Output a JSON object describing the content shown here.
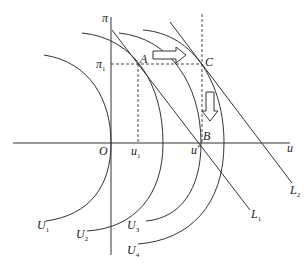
{
  "diagram": {
    "axes": {
      "y_label": "π",
      "x_label": "u",
      "origin_label": "O"
    },
    "points": {
      "A": "A",
      "B": "B",
      "C": "C"
    },
    "ticks": {
      "pi1": {
        "base": "π",
        "sub": "1"
      },
      "u1": {
        "base": "u",
        "sub": "1"
      },
      "ustar": {
        "base": "u",
        "sup": "*"
      }
    },
    "curves": [
      {
        "base": "U",
        "sub": "1"
      },
      {
        "base": "U",
        "sub": "2"
      },
      {
        "base": "U",
        "sub": "3"
      },
      {
        "base": "U",
        "sub": "4"
      }
    ],
    "lines": [
      {
        "base": "L",
        "sub": "1"
      },
      {
        "base": "L",
        "sub": "2"
      }
    ],
    "colors": {
      "stroke": "#333333",
      "background": "#ffffff"
    }
  }
}
